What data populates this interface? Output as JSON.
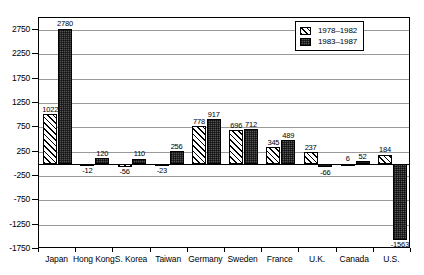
{
  "chart_data": {
    "type": "bar",
    "title": "",
    "xlabel": "",
    "ylabel": "",
    "grid": true,
    "legend_position": "top-right",
    "ylim": [
      -1750,
      3000
    ],
    "ytick_labels": [
      "2750",
      "2250",
      "1750",
      "1250",
      "750",
      "250",
      "-250",
      "-750",
      "-1250",
      "-1750"
    ],
    "ytick_values": [
      2750,
      2250,
      1750,
      1250,
      750,
      250,
      -250,
      -750,
      -1250,
      -1750
    ],
    "gridline_values": [
      2750,
      2250,
      1750,
      1250,
      750,
      250,
      -250,
      -750,
      -1250
    ],
    "categories": [
      "Japan",
      "Hong Kong",
      "S. Korea",
      "Taiwan",
      "Germany",
      "Sweden",
      "France",
      "U.K.",
      "Canada",
      "U.S."
    ],
    "series": [
      {
        "name": "1978-1982",
        "label": "1978–1982",
        "pattern": "diagonal-hatch",
        "values": [
          1022,
          -12,
          -56,
          -23,
          778,
          696,
          345,
          237,
          6,
          184
        ]
      },
      {
        "name": "1983-1987",
        "label": "1983–1987",
        "pattern": "solid-dark",
        "values": [
          2780,
          120,
          110,
          256,
          917,
          712,
          489,
          -66,
          52,
          -1563
        ]
      }
    ],
    "value_labels": {
      "Japan": [
        "1022",
        "2780"
      ],
      "Hong Kong": [
        "-12",
        "120"
      ],
      "S. Korea": [
        "-56",
        "110"
      ],
      "Taiwan": [
        "-23",
        "256"
      ],
      "Germany": [
        "778",
        "917"
      ],
      "Sweden": [
        "696",
        "712"
      ],
      "France": [
        "345",
        "489"
      ],
      "U.K.": [
        "237",
        "-66"
      ],
      "Canada": [
        "6",
        "52"
      ],
      "U.S.": [
        "184",
        "-1563"
      ]
    },
    "colors": {
      "series_0_fill": "#ffffff",
      "series_0_hatch": "#000000",
      "series_1_fill": "#555555",
      "axis": "#000000",
      "grid": "#9a9a9a",
      "background": "#ffffff",
      "text": "#000000"
    }
  }
}
